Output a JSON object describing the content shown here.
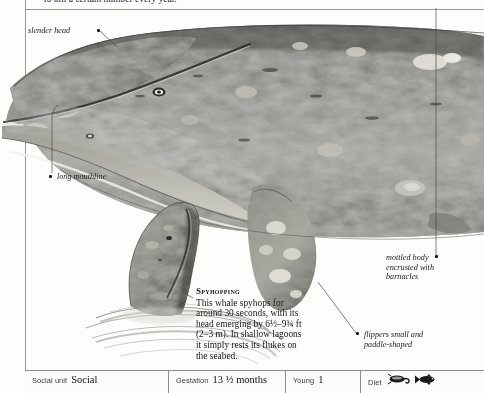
{
  "page": {
    "running_text": "to kill a certain number every year.",
    "background_color": "#fdfdfc",
    "rule_color": "#9a9a95"
  },
  "labels": [
    {
      "id": "slender-head",
      "text": "slender head"
    },
    {
      "id": "long-mouthline",
      "text": "long mouthline"
    },
    {
      "id": "mottled-body",
      "text": "mottled body\nencrusted with\nbarnacles"
    },
    {
      "id": "flippers",
      "text": "flippers small and\npaddle-shaped"
    }
  ],
  "caption": {
    "heading": "Spyhopping",
    "body": "This whale spyhops for around 30 seconds, with its head emerging by 6½–9¾ ft (2–3 m). In shallow lagoons it simply rests its flukes on the seabed."
  },
  "databar": [
    {
      "id": "social-unit",
      "name": "Social unit",
      "value": "Social",
      "icons": []
    },
    {
      "id": "gestation",
      "name": "Gestation",
      "value": "13 ½ months",
      "icons": []
    },
    {
      "id": "young",
      "name": "Young",
      "value": "1",
      "icons": []
    },
    {
      "id": "diet",
      "name": "Diet",
      "value": "",
      "icons": [
        "crustacean-icon",
        "fish-icon"
      ]
    }
  ]
}
